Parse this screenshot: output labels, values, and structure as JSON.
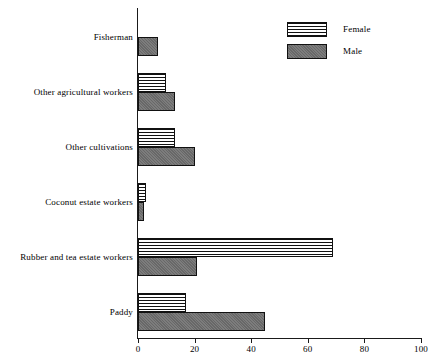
{
  "chart_data": {
    "type": "bar",
    "orientation": "horizontal",
    "title": "",
    "subtitle": "",
    "xlabel": "",
    "ylabel": "",
    "xlim": [
      0,
      100
    ],
    "ylim": null,
    "grid": false,
    "legend_position": "top-right",
    "categories": [
      "Fisherman",
      "Other agricultural workers",
      "Other cultivations",
      "Coconut estate workers",
      "Rubber and tea estate workers",
      "Paddy"
    ],
    "series": [
      {
        "name": "Female",
        "pattern": "horizontal-stripes",
        "color": "#ffffff",
        "values": [
          0,
          10,
          13,
          3,
          69,
          17
        ]
      },
      {
        "name": "Male",
        "pattern": "solid-gray",
        "color": "#6e6e6e",
        "values": [
          7,
          13,
          20,
          2,
          21,
          45
        ]
      }
    ],
    "xticks": [
      0,
      20,
      40,
      60,
      80,
      100
    ],
    "xtick_labels": [
      "0",
      "20",
      "40",
      "60",
      "80",
      "100"
    ]
  },
  "axis": {
    "x_tick_labels": [
      "0",
      "20",
      "40",
      "60",
      "80",
      "100"
    ]
  },
  "categories": {
    "labels": [
      "Fisherman",
      "Other agricultural workers",
      "Other cultivations",
      "Coconut estate workers",
      "Rubber and tea estate workers",
      "Paddy"
    ]
  },
  "legend": {
    "items": [
      {
        "label": "Female",
        "swatch": "female-striped-swatch"
      },
      {
        "label": "Male",
        "swatch": "male-gray-swatch"
      }
    ]
  },
  "colors": {
    "male_fill": "#6e6e6e",
    "female_fill": "#ffffff",
    "axis": "#1a1a1a",
    "outline": "#111111",
    "background": "#ffffff"
  }
}
